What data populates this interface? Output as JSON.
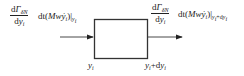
{
  "diagram": {
    "type": "control-volume flux diagram",
    "box": {
      "x": 94,
      "y": 19,
      "width": 53,
      "height": 39,
      "stroke": "#333333"
    },
    "inflow": {
      "fraction": {
        "num_d": "d",
        "num_sym": "Γ",
        "num_sub": "δN",
        "den_d": "d",
        "den_var": "y",
        "den_sub": "i"
      },
      "expr_prefix": "dt(",
      "expr_M": "Mw",
      "expr_ydot": "ẏ",
      "expr_ydot_sub": "i",
      "expr_close": ")|",
      "eval_at": "y",
      "eval_sub": "i"
    },
    "outflow": {
      "fraction": {
        "num_d": "d",
        "num_sym": "Γ",
        "num_sub": "δN",
        "den_d": "d",
        "den_var": "y",
        "den_sub": "i"
      },
      "expr_prefix": "dt(",
      "expr_M": "Mw",
      "expr_ydot": "ẏ",
      "expr_ydot_sub": "i",
      "expr_close": ")|",
      "eval_at": "y",
      "eval_sub": "i",
      "eval_plus": "+d",
      "eval_var2": "y",
      "eval_sub2": "i"
    },
    "bottom_left": {
      "var": "y",
      "sub": "i"
    },
    "bottom_right": {
      "var": "y",
      "sub": "i",
      "plus": "+d",
      "var2": "y",
      "sub2": "i"
    },
    "colors": {
      "line": "#333333",
      "text": "#222222",
      "background": "#ffffff"
    }
  }
}
